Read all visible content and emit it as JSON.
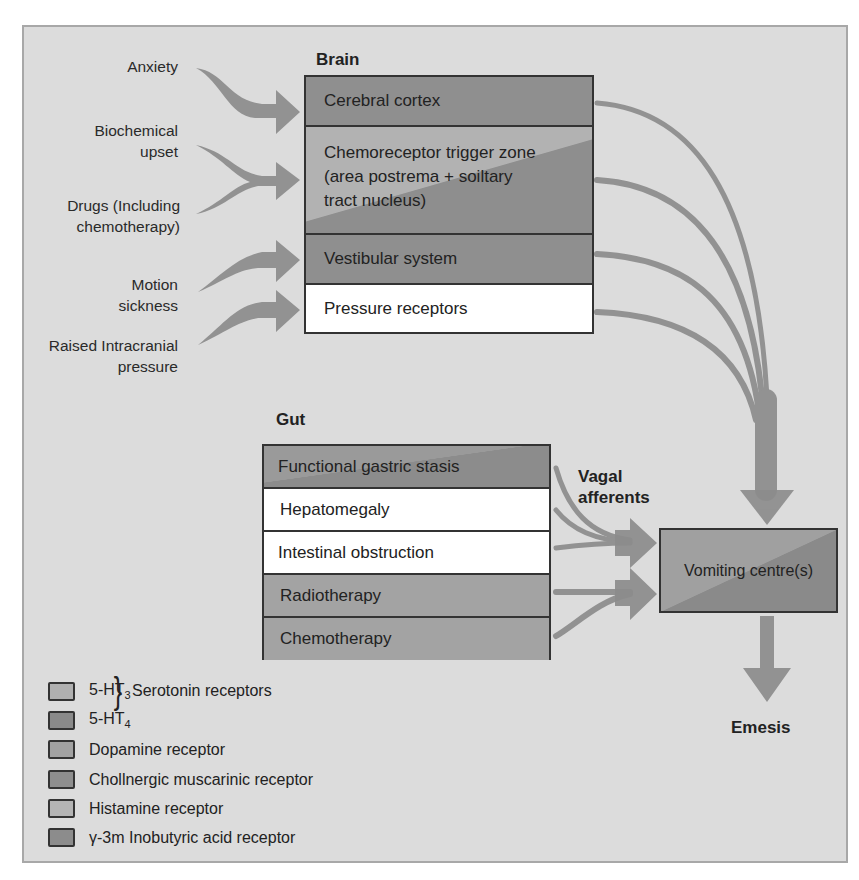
{
  "diagram": {
    "type": "flow-diagram"
  },
  "inputs": [
    {
      "label": "Anxiety",
      "target": "Cerebral cortex"
    },
    {
      "label": "Biochemical upset",
      "line1": "Biochemical",
      "line2": "upset",
      "target": "Chemoreceptor trigger zone"
    },
    {
      "label": "Drugs (Including chemotherapy)",
      "line1": "Drugs (Including",
      "line2": "chemotherapy)",
      "target": "Chemoreceptor trigger zone"
    },
    {
      "label": "Motion sickness",
      "line1": "Motion",
      "line2": "sickness",
      "target": "Vestibular system"
    },
    {
      "label": "Raised Intracranial pressure",
      "line1": "Raised Intracranial",
      "line2": "pressure",
      "target": "Pressure receptors"
    }
  ],
  "brain": {
    "heading": "Brain",
    "rows": [
      {
        "label": "Cerebral cortex",
        "fill": "dark"
      },
      {
        "label": "Chemoreceptor trigger zone",
        "line2": "(area postrema + soiltary",
        "line3": "tract nucleus)",
        "fill": "split"
      },
      {
        "label": "Vestibular system",
        "fill": "dark"
      },
      {
        "label": "Pressure receptors",
        "fill": "white"
      }
    ]
  },
  "gut": {
    "heading": "Gut",
    "rows": [
      {
        "label": "Functional gastric stasis",
        "fill": "split"
      },
      {
        "label": "Hepatomegaly",
        "fill": "white"
      },
      {
        "label": "Intestinal obstruction",
        "fill": "white"
      },
      {
        "label": "Radiotherapy",
        "fill": "mid"
      },
      {
        "label": "Chemotherapy",
        "fill": "mid"
      }
    ]
  },
  "vagal_label": {
    "line1": "Vagal",
    "line2": "afferents"
  },
  "vomiting_centre": {
    "label": "Vomiting centre(s)"
  },
  "output": {
    "label": "Emesis"
  },
  "legend": {
    "serotonin_group": "Serotonin receptors",
    "items": [
      {
        "label": "5-HT",
        "sub": "3",
        "color": "#b0b0b0"
      },
      {
        "label": "5-HT",
        "sub": "4",
        "color": "#8a8a8a"
      },
      {
        "label": "Dopamine receptor",
        "color": "#a2a2a2"
      },
      {
        "label": "Chollnergic muscarinic receptor",
        "color": "#8e8e8e"
      },
      {
        "label": "Histamine receptor",
        "color": "#b4b4b4"
      },
      {
        "label": "γ-3m Inobutyric acid receptor",
        "color": "#8c8c8c"
      }
    ]
  },
  "colors": {
    "background": "#dcdcdc",
    "arrow": "#8a8a8a",
    "border": "#333333"
  }
}
